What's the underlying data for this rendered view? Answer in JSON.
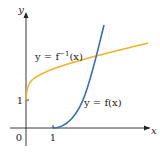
{
  "diagram": {
    "axes": {
      "x_label": "x",
      "y_label": "y",
      "origin_label": "0",
      "x_tick_label": "1",
      "y_tick_label": "1"
    },
    "curves": [
      {
        "name": "f",
        "label": "y = f(x)",
        "color": "#2f6fc0"
      },
      {
        "name": "f_inverse",
        "label_prefix": "y = f",
        "label_sup": "−1",
        "label_suffix": "(x)",
        "color": "#f0b429"
      }
    ]
  }
}
